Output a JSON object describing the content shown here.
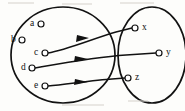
{
  "figure": {
    "type": "mapping-diagram",
    "title": ""
  },
  "sets": {
    "domain": {
      "name": "left-set",
      "shape": "ellipse",
      "cx": 63,
      "cy": 55,
      "rx": 52,
      "ry": 48,
      "elements": [
        {
          "id": "a",
          "label": "a",
          "marker": "o",
          "x": 31,
          "y": 24,
          "circle_x": 41,
          "circle_y": 24
        },
        {
          "id": "b",
          "label": "b",
          "marker": "o",
          "x": 12,
          "y": 40,
          "circle_x": 22,
          "circle_y": 40
        },
        {
          "id": "c",
          "label": "c",
          "marker": "o",
          "x": 34,
          "y": 53,
          "circle_x": 44,
          "circle_y": 53
        },
        {
          "id": "d",
          "label": "d",
          "marker": "o",
          "x": 21,
          "y": 68,
          "circle_x": 31,
          "circle_y": 68
        },
        {
          "id": "e",
          "label": "e",
          "marker": "o",
          "x": 34,
          "y": 86,
          "circle_x": 44,
          "circle_y": 86
        }
      ]
    },
    "codomain": {
      "name": "right-set",
      "shape": "ellipse",
      "cx": 152,
      "cy": 55,
      "rx": 34,
      "ry": 48,
      "elements": [
        {
          "id": "x",
          "label": "x",
          "marker": "o",
          "x": 142,
          "y": 28,
          "circle_x": 135,
          "circle_y": 28
        },
        {
          "id": "y",
          "label": "y",
          "marker": "o",
          "x": 166,
          "y": 53,
          "circle_x": 159,
          "circle_y": 53
        },
        {
          "id": "z",
          "label": "z",
          "marker": "o",
          "x": 135,
          "y": 78,
          "circle_x": 128,
          "circle_y": 78
        }
      ]
    }
  },
  "edges": [
    {
      "id": "edge-c-x",
      "from": "c",
      "to": "x",
      "arrowhead_at": [
        82,
        37
      ]
    },
    {
      "id": "edge-d-y",
      "from": "d",
      "to": "y",
      "arrowhead_at": [
        82,
        56
      ]
    },
    {
      "id": "edge-e-z",
      "from": "e",
      "to": "z",
      "arrowhead_at": [
        82,
        79
      ]
    }
  ],
  "colors": {
    "ink": "#121212",
    "paper": "#fdfdfb",
    "node_fill": "#ffffff"
  }
}
